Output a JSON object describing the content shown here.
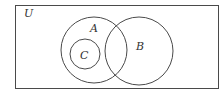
{
  "diagram": {
    "type": "venn",
    "universe": {
      "label": "U",
      "x": 15,
      "y": 5,
      "width": 203,
      "height": 83
    },
    "sets": [
      {
        "name": "A",
        "cx": 94,
        "cy": 50,
        "r": 33,
        "label_x": 92,
        "label_y": 32
      },
      {
        "name": "B",
        "cx": 139,
        "cy": 51,
        "r": 34,
        "label_x": 137,
        "label_y": 50
      },
      {
        "name": "C",
        "cx": 85,
        "cy": 54,
        "r": 15,
        "label_x": 81,
        "label_y": 59
      }
    ],
    "relations": [
      "C is a subset of A",
      "C is disjoint from B",
      "A and B overlap"
    ],
    "stroke_color": "#4a4a4a",
    "background": "#ffffff"
  }
}
